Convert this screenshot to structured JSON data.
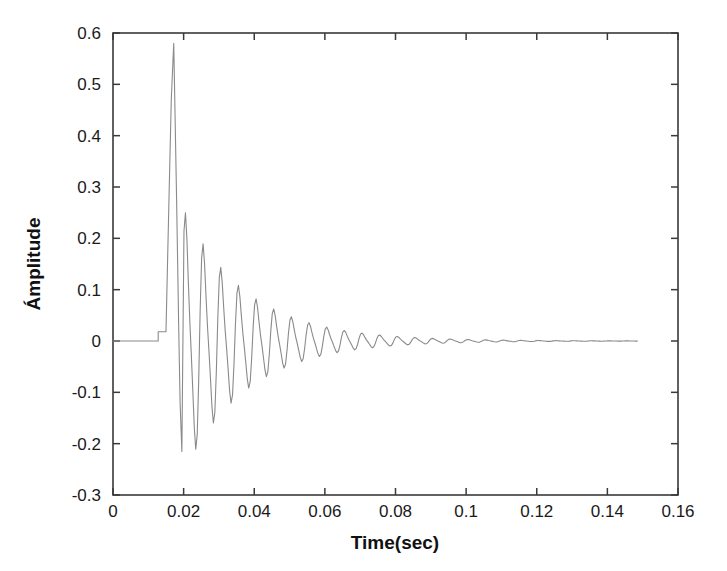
{
  "figure": {
    "background_color": "#ffffff",
    "frame_color": "#3a3a3a",
    "line_color": "#8a8a8a",
    "text_color": "#1a1a1a",
    "width": 727,
    "height": 571
  },
  "axes": {
    "x_label": "Time(sec)",
    "y_label": "Ámplitude",
    "x_ticks": [
      "0",
      "0.02",
      "0.04",
      "0.06",
      "0.08",
      "0.1",
      "0.12",
      "0.14",
      "0.16"
    ],
    "y_ticks": [
      "0.6",
      "0.5",
      "0.4",
      "0.3",
      "0.2",
      "0.1",
      "0",
      "-0.1",
      "-0.2",
      "-0.3"
    ]
  },
  "chart_data": {
    "type": "line",
    "title": "",
    "xlabel": "Time(sec)",
    "ylabel": "Ámplitude",
    "xlim": [
      0,
      0.16
    ],
    "ylim": [
      -0.3,
      0.6
    ],
    "xticks": [
      0,
      0.02,
      0.04,
      0.06,
      0.08,
      0.1,
      0.12,
      0.14,
      0.16
    ],
    "yticks": [
      -0.3,
      -0.2,
      -0.1,
      0,
      0.1,
      0.2,
      0.3,
      0.4,
      0.5,
      0.6
    ],
    "grid": false,
    "legend": false,
    "series": [
      {
        "name": "impulse response",
        "description": "Damped oscillatory impulse response: flat at zero until onset, single large positive spike then large negative excursion, followed by exponentially decaying ringing that settles to zero.",
        "onset_time": 0.0128,
        "end_time": 0.1485,
        "peak_value": 0.58,
        "peak_time": 0.0172,
        "min_value": -0.215,
        "min_time": 0.0195,
        "ring_period": 0.005,
        "ring_frequency_hz": 200,
        "decay_time_constant": 0.018,
        "x": [
          0,
          0.002,
          0.004,
          0.006,
          0.008,
          0.01,
          0.012,
          0.0128,
          0.0132,
          0.014,
          0.015,
          0.016,
          0.0166,
          0.0172,
          0.0178,
          0.0184,
          0.019,
          0.0195,
          0.02,
          0.0206,
          0.0212,
          0.0218,
          0.0224,
          0.023,
          0.0236,
          0.0242,
          0.0248,
          0.0254,
          0.026,
          0.0266,
          0.0272,
          0.028,
          0.0288,
          0.0296,
          0.0304,
          0.0312,
          0.032,
          0.033,
          0.034,
          0.035,
          0.036,
          0.037,
          0.038,
          0.039,
          0.04,
          0.0412,
          0.0424,
          0.0436,
          0.0448,
          0.046,
          0.0472,
          0.0484,
          0.05,
          0.052,
          0.054,
          0.056,
          0.058,
          0.06,
          0.063,
          0.066,
          0.069,
          0.072,
          0.076,
          0.08,
          0.085,
          0.09,
          0.096,
          0.102,
          0.108,
          0.114,
          0.12,
          0.128,
          0.136,
          0.144,
          0.1485
        ],
        "y": [
          0,
          0,
          0,
          0,
          0,
          0,
          0,
          0.0,
          0.018,
          0.018,
          0.018,
          0.3,
          0.5,
          0.58,
          0.32,
          0.02,
          -0.15,
          -0.215,
          -0.1,
          0.075,
          0.1,
          0.045,
          0.04,
          -0.05,
          -0.09,
          0.02,
          0.075,
          0.04,
          0.012,
          -0.055,
          -0.07,
          0.015,
          0.05,
          0.035,
          0.005,
          -0.045,
          -0.055,
          0.012,
          0.042,
          0.03,
          -0.01,
          -0.04,
          -0.047,
          0.01,
          0.036,
          0.026,
          -0.008,
          -0.034,
          -0.038,
          0.008,
          0.03,
          0.022,
          -0.028,
          0.024,
          -0.022,
          0.019,
          -0.017,
          0.015,
          -0.012,
          0.011,
          -0.009,
          0.008,
          -0.007,
          0.006,
          -0.005,
          0.004,
          -0.0035,
          0.003,
          -0.0025,
          0.002,
          -0.0018,
          0.0014,
          -0.001,
          0.0008,
          0.0
        ]
      }
    ]
  }
}
